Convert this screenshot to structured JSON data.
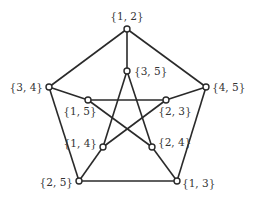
{
  "diagram": {
    "type": "graph",
    "name": "Petersen graph",
    "nodes": [
      {
        "id": "12",
        "label": "{1, 2}",
        "x": 127,
        "y": 29,
        "lx": 127,
        "ly": 20,
        "anchor": "middle"
      },
      {
        "id": "35",
        "label": "{3, 5}",
        "x": 127,
        "y": 71,
        "lx": 134,
        "ly": 75,
        "anchor": "start"
      },
      {
        "id": "34",
        "label": "{3, 4}",
        "x": 49,
        "y": 87,
        "lx": 43,
        "ly": 91,
        "anchor": "end"
      },
      {
        "id": "45",
        "label": "{4, 5}",
        "x": 206,
        "y": 87,
        "lx": 212,
        "ly": 91,
        "anchor": "start"
      },
      {
        "id": "15",
        "label": "{1, 5}",
        "x": 88,
        "y": 100,
        "lx": 80,
        "ly": 115,
        "anchor": "middle"
      },
      {
        "id": "23",
        "label": "{2, 3}",
        "x": 166,
        "y": 100,
        "lx": 175,
        "ly": 115,
        "anchor": "middle"
      },
      {
        "id": "14",
        "label": "{1, 4}",
        "x": 103,
        "y": 147,
        "lx": 97,
        "ly": 147,
        "anchor": "end"
      },
      {
        "id": "24",
        "label": "{2, 4}",
        "x": 152,
        "y": 147,
        "lx": 158,
        "ly": 146,
        "anchor": "start"
      },
      {
        "id": "25",
        "label": "{2, 5}",
        "x": 79,
        "y": 181,
        "lx": 73,
        "ly": 186,
        "anchor": "end"
      },
      {
        "id": "13",
        "label": "{1, 3}",
        "x": 177,
        "y": 181,
        "lx": 182,
        "ly": 187,
        "anchor": "start"
      }
    ],
    "edges": [
      [
        "12",
        "34"
      ],
      [
        "12",
        "45"
      ],
      [
        "34",
        "25"
      ],
      [
        "45",
        "13"
      ],
      [
        "25",
        "13"
      ],
      [
        "12",
        "35"
      ],
      [
        "34",
        "15"
      ],
      [
        "45",
        "23"
      ],
      [
        "25",
        "14"
      ],
      [
        "13",
        "24"
      ],
      [
        "35",
        "14"
      ],
      [
        "35",
        "24"
      ],
      [
        "15",
        "23"
      ],
      [
        "15",
        "24"
      ],
      [
        "23",
        "14"
      ]
    ]
  }
}
